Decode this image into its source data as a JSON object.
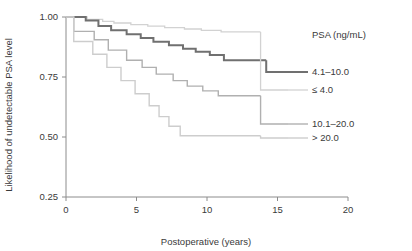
{
  "chart_data": {
    "type": "line",
    "title": "",
    "xlabel": "Postoperative (years)",
    "ylabel": "Likelihood of undetectable PSA level",
    "xlim": [
      0,
      20
    ],
    "ylim": [
      0.25,
      1.0
    ],
    "xticks": [
      "0",
      "5",
      "10",
      "15",
      "20"
    ],
    "xtick_values": [
      0,
      5,
      10,
      15,
      20
    ],
    "yticks": [
      "0.25",
      "0.50",
      "0.75",
      "1.00"
    ],
    "ytick_values": [
      0.25,
      0.5,
      0.75,
      1.0
    ],
    "grid": false,
    "legend_position": "right",
    "legend_title": "PSA (ng/mL)",
    "series": [
      {
        "name": "≤ 4.0",
        "color": "#d2d2d2",
        "width": 1.3,
        "legend_label": "≤ 4.0",
        "steps": [
          [
            0.0,
            1.0
          ],
          [
            1.5,
            1.0
          ],
          [
            1.5,
            0.99
          ],
          [
            2.6,
            0.99
          ],
          [
            2.6,
            0.982
          ],
          [
            3.4,
            0.982
          ],
          [
            3.4,
            0.975
          ],
          [
            4.6,
            0.975
          ],
          [
            4.6,
            0.968
          ],
          [
            5.8,
            0.968
          ],
          [
            5.8,
            0.962
          ],
          [
            7.0,
            0.962
          ],
          [
            7.0,
            0.956
          ],
          [
            8.4,
            0.956
          ],
          [
            8.4,
            0.95
          ],
          [
            9.6,
            0.95
          ],
          [
            9.6,
            0.944
          ],
          [
            11.0,
            0.944
          ],
          [
            11.0,
            0.938
          ],
          [
            13.8,
            0.938
          ]
        ],
        "endpoint": [
          13.8,
          0.938
        ]
      },
      {
        "name": "4.1–10.0",
        "color": "#707070",
        "width": 2.0,
        "legend_label": "4.1–10.0",
        "steps": [
          [
            0.0,
            1.0
          ],
          [
            1.4,
            1.0
          ],
          [
            1.4,
            0.985
          ],
          [
            2.3,
            0.985
          ],
          [
            2.3,
            0.962
          ],
          [
            3.2,
            0.962
          ],
          [
            3.2,
            0.945
          ],
          [
            4.3,
            0.945
          ],
          [
            4.3,
            0.928
          ],
          [
            5.3,
            0.928
          ],
          [
            5.3,
            0.912
          ],
          [
            6.2,
            0.912
          ],
          [
            6.2,
            0.897
          ],
          [
            7.3,
            0.897
          ],
          [
            7.3,
            0.882
          ],
          [
            8.3,
            0.882
          ],
          [
            8.3,
            0.868
          ],
          [
            9.2,
            0.868
          ],
          [
            9.2,
            0.855
          ],
          [
            10.2,
            0.855
          ],
          [
            10.2,
            0.842
          ],
          [
            11.2,
            0.842
          ],
          [
            11.2,
            0.82
          ],
          [
            14.2,
            0.82
          ]
        ],
        "endpoint": [
          14.2,
          0.82
        ]
      },
      {
        "name": "10.1–20.0",
        "color": "#b0b0b0",
        "width": 1.4,
        "legend_label": "10.1–20.0",
        "steps": [
          [
            0.0,
            1.0
          ],
          [
            0.55,
            1.0
          ],
          [
            0.55,
            0.94
          ],
          [
            2.0,
            0.94
          ],
          [
            2.0,
            0.905
          ],
          [
            3.0,
            0.905
          ],
          [
            3.0,
            0.862
          ],
          [
            4.3,
            0.862
          ],
          [
            4.3,
            0.82
          ],
          [
            5.4,
            0.82
          ],
          [
            5.4,
            0.79
          ],
          [
            6.4,
            0.79
          ],
          [
            6.4,
            0.762
          ],
          [
            7.6,
            0.762
          ],
          [
            7.6,
            0.735
          ],
          [
            8.6,
            0.735
          ],
          [
            8.6,
            0.712
          ],
          [
            9.7,
            0.712
          ],
          [
            9.7,
            0.692
          ],
          [
            10.8,
            0.692
          ],
          [
            10.8,
            0.672
          ],
          [
            13.8,
            0.672
          ]
        ],
        "endpoint": [
          13.8,
          0.672
        ]
      },
      {
        "name": "> 20.0",
        "color": "#cdcdcd",
        "width": 1.4,
        "legend_label": "> 20.0",
        "steps": [
          [
            0.0,
            1.0
          ],
          [
            0.55,
            1.0
          ],
          [
            0.55,
            0.898
          ],
          [
            1.9,
            0.898
          ],
          [
            1.9,
            0.845
          ],
          [
            2.9,
            0.845
          ],
          [
            2.9,
            0.79
          ],
          [
            3.9,
            0.79
          ],
          [
            3.9,
            0.735
          ],
          [
            4.9,
            0.735
          ],
          [
            4.9,
            0.68
          ],
          [
            5.9,
            0.68
          ],
          [
            5.9,
            0.63
          ],
          [
            6.6,
            0.63
          ],
          [
            6.6,
            0.585
          ],
          [
            7.3,
            0.585
          ],
          [
            7.3,
            0.545
          ],
          [
            8.1,
            0.545
          ],
          [
            8.1,
            0.505
          ],
          [
            13.8,
            0.505
          ]
        ],
        "endpoint": [
          13.8,
          0.505
        ]
      }
    ]
  },
  "legend": {
    "title": "PSA (ng/mL)",
    "entries": [
      {
        "label": "4.1–10.0",
        "color": "#707070"
      },
      {
        "label": "≤ 4.0",
        "color": "#d2d2d2"
      },
      {
        "label": "10.1–20.0",
        "color": "#b0b0b0"
      },
      {
        "label": "> 20.0",
        "color": "#cdcdcd"
      }
    ]
  },
  "axes": {
    "x_title": "Postoperative (years)",
    "y_title": "Likelihood of undetectable PSA level"
  }
}
